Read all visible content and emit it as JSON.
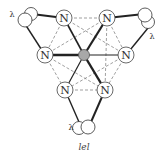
{
  "diagram": {
    "caption": "lel",
    "center_atom": {
      "label": "",
      "color": "#a8a8a8",
      "x": 84,
      "y": 55
    },
    "atom_label": "N",
    "chelate_label": "λ",
    "nitrogens": [
      {
        "id": "n1",
        "label": "N",
        "x": 64,
        "y": 18
      },
      {
        "id": "n2",
        "label": "N",
        "x": 107,
        "y": 18
      },
      {
        "id": "n3",
        "label": "N",
        "x": 45,
        "y": 55
      },
      {
        "id": "n4",
        "label": "N",
        "x": 126,
        "y": 55
      },
      {
        "id": "n5",
        "label": "N",
        "x": 65,
        "y": 90
      },
      {
        "id": "n6",
        "label": "N",
        "x": 105,
        "y": 90
      }
    ],
    "chelate_rings": [
      {
        "label": "λ",
        "label_pos": [
          12,
          16
        ]
      },
      {
        "label": "λ",
        "label_pos": [
          152,
          38
        ]
      },
      {
        "label": "λ",
        "label_pos": [
          73,
          130
        ]
      }
    ]
  }
}
